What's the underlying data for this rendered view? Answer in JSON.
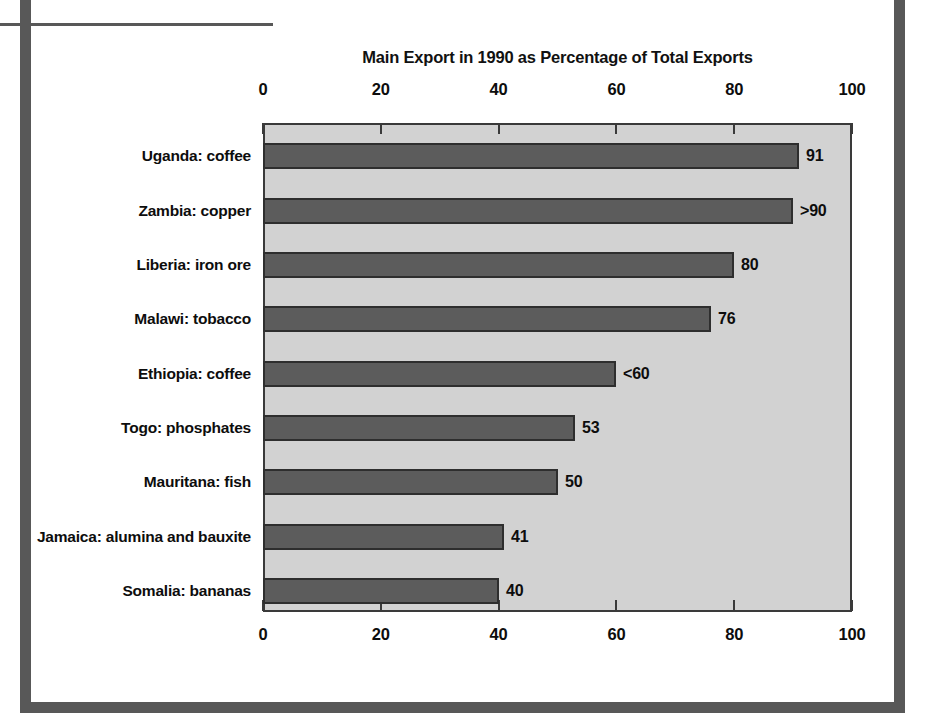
{
  "figure": {
    "frame_color": "#585858",
    "plot_background": "#d2d2d2",
    "bar_color": "#5c5c5c",
    "bar_outline": "#2e2e2e",
    "axis_color": "#3a3a3a"
  },
  "chart_data": {
    "type": "bar",
    "orientation": "horizontal",
    "title": "Main Export in 1990 as Percentage of Total Exports",
    "xlabel": "",
    "ylabel": "",
    "xlim": [
      0,
      100
    ],
    "grid": false,
    "legend": "none",
    "xticks": [
      0,
      20,
      40,
      60,
      80,
      100
    ],
    "xtick_labels": [
      "0",
      "20",
      "40",
      "60",
      "80",
      "100"
    ],
    "axis_positions": [
      "top",
      "bottom"
    ],
    "categories": [
      "Uganda: coffee",
      "Zambia: copper",
      "Liberia: iron ore",
      "Malawi: tobacco",
      "Ethiopia: coffee",
      "Togo: phosphates",
      "Mauritana: fish",
      "Jamaica: alumina and bauxite",
      "Somalia: bananas"
    ],
    "values": [
      91,
      90,
      80,
      76,
      60,
      53,
      50,
      41,
      40
    ],
    "data_labels": [
      "91",
      ">90",
      "80",
      "76",
      "<60",
      "53",
      "50",
      "41",
      "40"
    ]
  }
}
